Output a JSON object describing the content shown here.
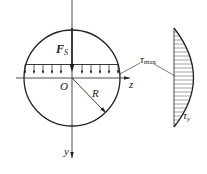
{
  "figure": {
    "type": "circular-section-shear-stress",
    "labels": {
      "force": "F",
      "force_sub": "S",
      "origin": "O",
      "radius": "R",
      "z_axis": "z",
      "y_axis": "y",
      "tau_max": "τ",
      "tau_max_sub": "max",
      "tau_y": "τ",
      "tau_y_sub": "y"
    },
    "colors": {
      "stroke": "#222222",
      "background": "#ffffff"
    },
    "distribution": {
      "shape": "parabolic",
      "hatched": true,
      "peak_at": "neutral axis (z)"
    }
  }
}
